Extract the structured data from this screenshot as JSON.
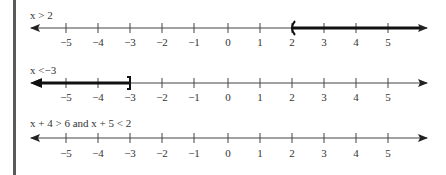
{
  "figure": {
    "axis": {
      "min": -5,
      "max": 5,
      "tick_labels": [
        "−5",
        "−4",
        "−3",
        "−2",
        "−1",
        "0",
        "1",
        "2",
        "3",
        "4",
        "5"
      ]
    },
    "rows": [
      {
        "title": "x > 2",
        "shaded_from": 2,
        "shaded_to": "inf",
        "endpoint": 2,
        "endpoint_style": "open-paren"
      },
      {
        "title": "x <−3",
        "shaded_from": "-inf",
        "shaded_to": -3,
        "endpoint": -3,
        "endpoint_style": "closed-bracket"
      },
      {
        "title": "x + 4 > 6 and  x + 5 < 2",
        "shaded_from": null,
        "shaded_to": null,
        "endpoint": null,
        "endpoint_style": "none"
      }
    ]
  }
}
